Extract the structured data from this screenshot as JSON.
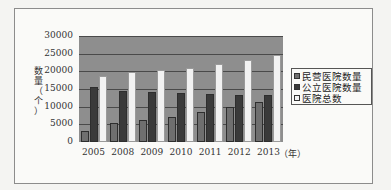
{
  "chart_data": {
    "type": "bar",
    "title": "",
    "xlabel": "（年）",
    "ylabel": "数量（个）",
    "ylim": [
      0,
      30000
    ],
    "yticks": [
      0,
      5000,
      10000,
      15000,
      20000,
      25000,
      30000
    ],
    "categories": [
      "2005",
      "2008",
      "2009",
      "2010",
      "2011",
      "2012",
      "2013"
    ],
    "series": [
      {
        "name": "民营医院数量",
        "color": "#6f6f6f",
        "values": [
          3220,
          5403,
          6240,
          7068,
          8440,
          9786,
          11313
        ]
      },
      {
        "name": "公立医院数量",
        "color": "#3a3a3a",
        "values": [
          15483,
          14309,
          14051,
          13850,
          13539,
          13384,
          13396
        ]
      },
      {
        "name": "医院总数",
        "color": "#f2f2f2",
        "values": [
          18703,
          19712,
          20291,
          20918,
          21979,
          23170,
          24709
        ]
      }
    ],
    "grid": true,
    "legend_position": "right"
  },
  "axis": {
    "ylabel_chars": [
      "数",
      "量",
      "（",
      "个",
      "）"
    ],
    "x_unit": "（年）",
    "yticks": [
      "30000",
      "25000",
      "20000",
      "15000",
      "10000",
      "5000",
      "0"
    ]
  },
  "legend": {
    "items": [
      {
        "label": "民营医院数量",
        "color": "#6f6f6f"
      },
      {
        "label": "公立医院数量",
        "color": "#3a3a3a"
      },
      {
        "label": "医院总数",
        "color": "#f2f2f2"
      }
    ]
  }
}
